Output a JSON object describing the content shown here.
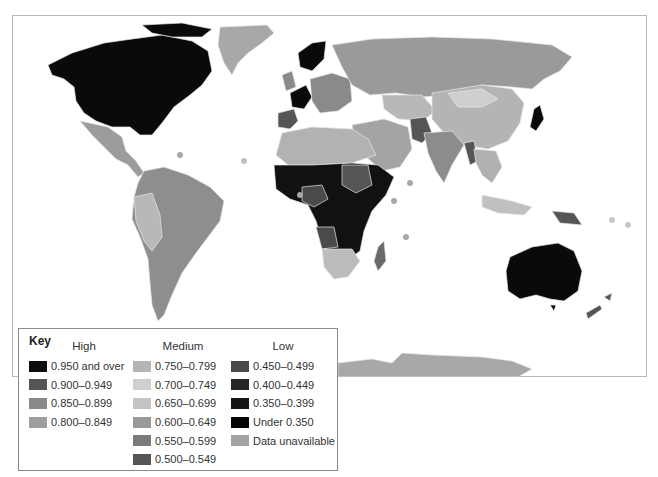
{
  "map": {
    "type": "choropleth",
    "subject": "world countries shaded by index value",
    "colors": {
      "ocean": "#ffffff",
      "border": "#e8e8e8",
      "frame": "#b8b8b8"
    },
    "regions": [
      {
        "name": "North America (Canada/USA)",
        "class": "0.950 and over",
        "color": "#0a0a0a"
      },
      {
        "name": "Greenland",
        "class": "Data unavailable",
        "color": "#a8a8a8"
      },
      {
        "name": "Mexico/Central America",
        "class": "0.800-0.849",
        "color": "#9c9c9c"
      },
      {
        "name": "South America",
        "class": "0.800-0.849",
        "color": "#8e8e8e"
      },
      {
        "name": "Western Europe",
        "class": "0.950 and over",
        "color": "#0a0a0a"
      },
      {
        "name": "Eastern Europe",
        "class": "0.850-0.899",
        "color": "#8a8a8a"
      },
      {
        "name": "Russia",
        "class": "0.800-0.849",
        "color": "#9a9a9a"
      },
      {
        "name": "Central Asia",
        "class": "0.700-0.749",
        "color": "#b8b8b8"
      },
      {
        "name": "China/Mongolia",
        "class": "0.750-0.799",
        "color": "#b4b4b4"
      },
      {
        "name": "Middle East",
        "class": "0.750-0.799",
        "color": "#a4a4a4"
      },
      {
        "name": "India",
        "class": "0.600-0.649",
        "color": "#8c8c8c"
      },
      {
        "name": "Southeast Asia",
        "class": "0.700-0.749",
        "color": "#b0b0b0"
      },
      {
        "name": "Japan",
        "class": "0.950 and over",
        "color": "#0a0a0a"
      },
      {
        "name": "North Africa",
        "class": "0.700-0.749",
        "color": "#b2b2b2"
      },
      {
        "name": "Sub-Saharan Africa",
        "class": "Under 0.350",
        "color": "#111111"
      },
      {
        "name": "Southern Africa",
        "class": "0.650-0.699",
        "color": "#bcbcbc"
      },
      {
        "name": "Madagascar",
        "class": "0.500-0.549",
        "color": "#6a6a6a"
      },
      {
        "name": "Australia",
        "class": "0.950 and over",
        "color": "#0a0a0a"
      },
      {
        "name": "New Zealand",
        "class": "0.900-0.949",
        "color": "#555555"
      },
      {
        "name": "Antarctica",
        "class": "Data unavailable",
        "color": "#a8a8a8"
      }
    ]
  },
  "key": {
    "title": "Key",
    "groups": [
      {
        "heading": "High",
        "items": [
          {
            "label": "0.950 and over",
            "color": "#0d0d0d"
          },
          {
            "label": "0.900–0.949",
            "color": "#555555"
          },
          {
            "label": "0.850–0.899",
            "color": "#888888"
          },
          {
            "label": "0.800–0.849",
            "color": "#9e9e9e"
          }
        ]
      },
      {
        "heading": "Medium",
        "items": [
          {
            "label": "0.750–0.799",
            "color": "#b5b5b5"
          },
          {
            "label": "0.700–0.749",
            "color": "#cfcfcf"
          },
          {
            "label": "0.650–0.699",
            "color": "#c4c4c4"
          },
          {
            "label": "0.600–0.649",
            "color": "#9a9a9a"
          },
          {
            "label": "0.550–0.599",
            "color": "#7a7a7a"
          },
          {
            "label": "0.500–0.549",
            "color": "#555555"
          }
        ]
      },
      {
        "heading": "Low",
        "items": [
          {
            "label": "0.450–0.499",
            "color": "#4a4a4a"
          },
          {
            "label": "0.400–0.449",
            "color": "#262626"
          },
          {
            "label": "0.350–0.399",
            "color": "#141414"
          },
          {
            "label": "Under 0.350",
            "color": "#050505"
          },
          {
            "label": "Data unavailable",
            "color": "#a3a3a3"
          }
        ]
      }
    ]
  }
}
